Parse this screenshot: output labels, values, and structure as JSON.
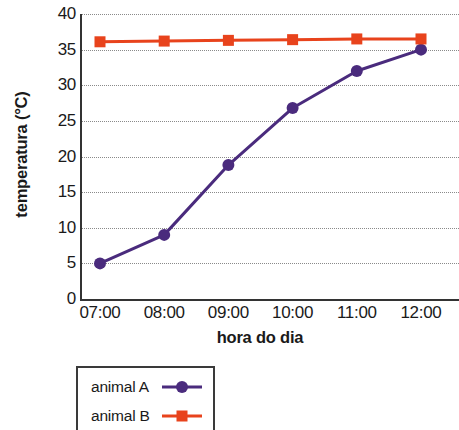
{
  "chart_data": {
    "type": "line",
    "title": "",
    "xlabel": "hora do dia",
    "ylabel": "temperatura (°C)",
    "categories": [
      "07:00",
      "08:00",
      "09:00",
      "10:00",
      "11:00",
      "12:00"
    ],
    "ylim": [
      0,
      40
    ],
    "yticks": [
      0,
      5,
      10,
      15,
      20,
      25,
      30,
      35,
      40
    ],
    "ytick_labels": [
      "0",
      "5",
      "10",
      "15",
      "20",
      "25",
      "30",
      "35",
      "40"
    ],
    "grid": true,
    "grid_style": "dotted-horizontal",
    "legend_position": "below-left",
    "series": [
      {
        "name": "animal A",
        "values": [
          5,
          9,
          18.8,
          26.8,
          32,
          35
        ],
        "color": "#4a2b7d",
        "marker": "circle"
      },
      {
        "name": "animal B",
        "values": [
          36.1,
          36.2,
          36.3,
          36.4,
          36.5,
          36.5
        ],
        "color": "#e8431c",
        "marker": "square"
      }
    ]
  },
  "axes": {
    "y_title": "temperatura (°C)",
    "x_title": "hora do dia"
  },
  "legend": {
    "entries": [
      {
        "label": "animal A",
        "color": "#4a2b7d",
        "marker": "circle"
      },
      {
        "label": "animal B",
        "color": "#e8431c",
        "marker": "square"
      }
    ]
  },
  "colors": {
    "series_a": "#4a2b7d",
    "series_b": "#e8431c",
    "axis": "#333333",
    "grid": "#8a8a8a",
    "background": "#ffffff"
  }
}
